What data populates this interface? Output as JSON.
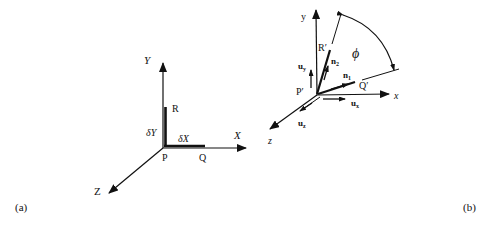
{
  "figure": {
    "panel_a": {
      "label": "(a)",
      "axes": {
        "x": "X",
        "y": "Y",
        "z": "Z"
      },
      "points": {
        "origin": "P",
        "on_x": "Q",
        "on_y": "R"
      },
      "segments": {
        "dx": "δX",
        "dy": "δY"
      }
    },
    "panel_b": {
      "label": "(b)",
      "axes": {
        "x": "x",
        "y": "y",
        "z": "z"
      },
      "points": {
        "origin": "P′",
        "q": "Q′",
        "r": "R′"
      },
      "unit_vectors": {
        "ux": "u",
        "ux_sub": "x",
        "uy": "u",
        "uy_sub": "y",
        "uz": "u",
        "uz_sub": "z",
        "n1": "n",
        "n1_sub": "1",
        "n2": "n",
        "n2_sub": "2"
      },
      "angle": "ϕ"
    }
  },
  "colors": {
    "ink": "#111111",
    "background": "#ffffff"
  }
}
